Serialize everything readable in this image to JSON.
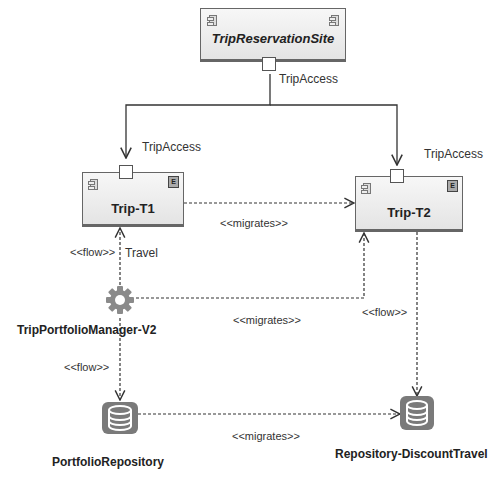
{
  "components": {
    "site": {
      "name": "TripReservationSite",
      "port_label": "TripAccess"
    },
    "t1": {
      "name": "Trip-T1",
      "port_label": "TripAccess"
    },
    "t2": {
      "name": "Trip-T2",
      "port_label": "TripAccess"
    }
  },
  "nodes": {
    "manager": {
      "name": "TripPortfolioManager-V2",
      "icon": "gear-icon"
    },
    "portfolio_repo": {
      "name": "PortfolioRepository",
      "icon": "database-icon"
    },
    "discount_repo": {
      "name": "Repository-DiscountTravel",
      "icon": "database-icon"
    }
  },
  "connectors": {
    "migrates_t1_t2": "<<migrates>>",
    "flow_travel": "<<flow>>",
    "travel_label": "Travel",
    "migrates_manager_t2": "<<migrates>>",
    "flow_t2_discount": "<<flow>>",
    "flow_manager_portfolio": "<<flow>>",
    "migrates_repos": "<<migrates>>"
  },
  "colors": {
    "line": "#333333",
    "box_fill": "#eeeeee",
    "icon_gray": "#8a8a8a"
  }
}
